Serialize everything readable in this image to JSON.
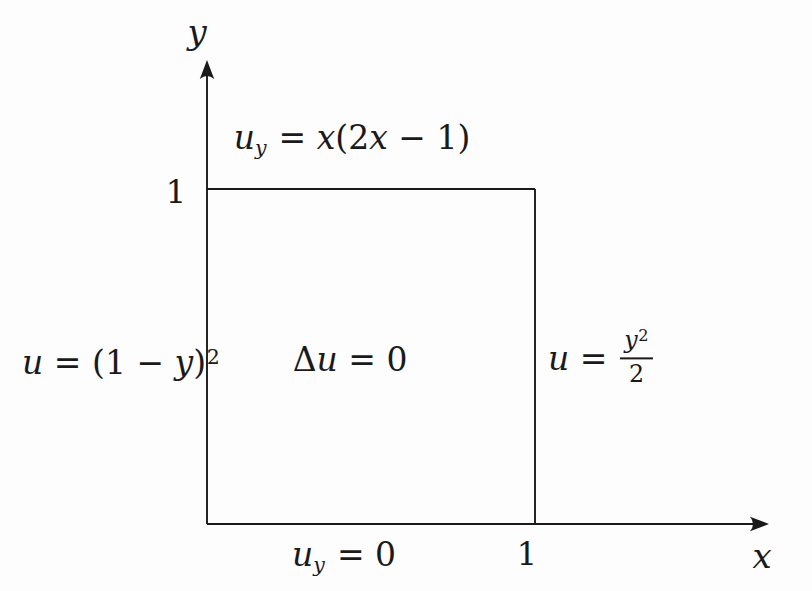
{
  "figure": {
    "type": "boundary-value-problem-diagram",
    "background_color": "#fdfdfd",
    "ink_color": "#1a1a1a",
    "axis_labels": {
      "x": "x",
      "y": "y"
    },
    "ticks": {
      "y_one": "1",
      "x_one": "1"
    }
  },
  "equations": {
    "top_boundary": {
      "base": "u",
      "sub": "y",
      "eq": " = ",
      "f1": "x",
      "p1": "(2",
      "f2": "x",
      "p2": " − 1)"
    },
    "left_boundary": {
      "base": "u",
      "eq": " = ",
      "p1": "(1 − ",
      "v": "y",
      "p2": ")",
      "sup": "2"
    },
    "interior": {
      "delta": "Δ",
      "base": "u",
      "eq": " = ",
      "rhs": "0"
    },
    "right_boundary": {
      "base": "u",
      "eq": " = ",
      "num_v": "y",
      "num_sup": "2",
      "den": "2"
    },
    "bottom_boundary": {
      "base": "u",
      "sub": "y",
      "eq": " = ",
      "rhs": "0"
    }
  }
}
